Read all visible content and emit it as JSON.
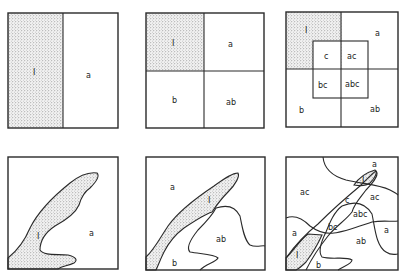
{
  "figure": {
    "panels": [
      {
        "id": "top-1",
        "labels": {
          "control": "I",
          "a": "a"
        }
      },
      {
        "id": "top-2",
        "labels": {
          "control": "I",
          "a": "a",
          "b": "b",
          "ab": "ab"
        }
      },
      {
        "id": "top-3",
        "labels": {
          "control": "I",
          "a": "a",
          "b": "b",
          "ab": "ab",
          "c": "c",
          "ac": "ac",
          "bc": "bc",
          "abc": "abc"
        }
      },
      {
        "id": "bottom-1",
        "labels": {
          "control": "I",
          "a": "a"
        }
      },
      {
        "id": "bottom-2",
        "labels": {
          "control": "I",
          "a": "a",
          "b": "b",
          "ab": "ab"
        }
      },
      {
        "id": "bottom-3",
        "labels": {
          "control_top": "I",
          "control_bottom": "I",
          "a_top": "a",
          "a_left": "a",
          "a_right": "a",
          "ac_left": "ac",
          "ac_right": "ac",
          "c": "c",
          "abc": "abc",
          "bc": "bc",
          "ab": "ab",
          "b": "b"
        }
      }
    ]
  }
}
